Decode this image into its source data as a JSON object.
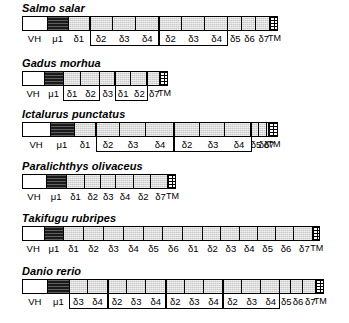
{
  "figure": {
    "type": "gene-segment-map",
    "fills": {
      "vh": "white",
      "mu1": "black",
      "delta": "light-gray-stipple",
      "tm": "cross-hatched-grid"
    },
    "colors": {
      "outline": "#000000",
      "delta_fill": "#c9c9c9",
      "mu_fill": "#1a1a1a",
      "vh_fill": "#ffffff",
      "page_bg": "#ffffff"
    }
  },
  "rows": [
    {
      "species": "Salmo salar",
      "bar_left": 22,
      "bar_width": 256,
      "segments": [
        {
          "label": "VH",
          "fill": "f-white",
          "w": 28
        },
        {
          "label": "μ1",
          "fill": "f-black",
          "w": 24
        },
        {
          "label": "δ1",
          "fill": "f-gray",
          "w": 24
        },
        {
          "label": "δ2",
          "fill": "f-gray",
          "w": 26
        },
        {
          "label": "δ3",
          "fill": "f-gray",
          "w": 26
        },
        {
          "label": "δ4",
          "fill": "f-gray",
          "w": 26
        },
        {
          "label": "δ2",
          "fill": "f-gray",
          "w": 26
        },
        {
          "label": "δ3",
          "fill": "f-gray",
          "w": 26
        },
        {
          "label": "δ4",
          "fill": "f-gray",
          "w": 26
        },
        {
          "label": "δ5",
          "fill": "f-gray",
          "w": 16
        },
        {
          "label": "δ6",
          "fill": "f-gray",
          "w": 16
        },
        {
          "label": "δ7",
          "fill": "f-gray",
          "w": 16
        },
        {
          "label": "TM",
          "fill": "f-grid",
          "w": 8
        }
      ],
      "brackets": [
        {
          "start_index": 3,
          "end_index": 5
        },
        {
          "start_index": 6,
          "end_index": 8
        }
      ]
    },
    {
      "species": "Gadus morhua",
      "bar_left": 22,
      "bar_width": 146,
      "segments": [
        {
          "label": "VH",
          "fill": "f-white",
          "w": 25
        },
        {
          "label": "μ1",
          "fill": "f-black",
          "w": 22
        },
        {
          "label": "δ1",
          "fill": "f-gray",
          "w": 20
        },
        {
          "label": "δ2",
          "fill": "f-gray",
          "w": 22
        },
        {
          "label": "δ3",
          "fill": "f-gray",
          "w": 17
        },
        {
          "label": "δ1",
          "fill": "f-gray",
          "w": 18
        },
        {
          "label": "δ2",
          "fill": "f-gray",
          "w": 19
        },
        {
          "label": "δ7",
          "fill": "f-gray",
          "w": 15
        },
        {
          "label": "TM",
          "fill": "f-grid",
          "w": 8
        }
      ],
      "brackets": [
        {
          "start_index": 2,
          "end_index": 3
        },
        {
          "start_index": 5,
          "end_index": 6
        }
      ]
    },
    {
      "species": "Ictalurus punctatus",
      "bar_left": 22,
      "bar_width": 256,
      "segments": [
        {
          "label": "VH",
          "fill": "f-white",
          "w": 28
        },
        {
          "label": "μ1",
          "fill": "f-black",
          "w": 24
        },
        {
          "label": "δ1",
          "fill": "f-gray",
          "w": 22
        },
        {
          "label": "δ2",
          "fill": "f-gray",
          "w": 24
        },
        {
          "label": "δ3",
          "fill": "f-gray",
          "w": 26
        },
        {
          "label": "δ4",
          "fill": "f-gray",
          "w": 28
        },
        {
          "label": "δ2",
          "fill": "f-gray",
          "w": 26
        },
        {
          "label": "δ3",
          "fill": "f-gray",
          "w": 26
        },
        {
          "label": "δ4",
          "fill": "f-gray",
          "w": 26
        },
        {
          "label": "δ5",
          "fill": "f-gray",
          "w": 8
        },
        {
          "label": "δ6",
          "fill": "f-gray",
          "w": 8
        },
        {
          "label": "δ7",
          "fill": "f-gray",
          "w": 2
        },
        {
          "label": "TM",
          "fill": "f-grid",
          "w": 8
        }
      ],
      "brackets": [
        {
          "start_index": 3,
          "end_index": 5
        },
        {
          "start_index": 6,
          "end_index": 8
        }
      ]
    },
    {
      "species": "Paralichthys olivaceus",
      "bar_left": 22,
      "bar_width": 154,
      "segments": [
        {
          "label": "VH",
          "fill": "f-white",
          "w": 27
        },
        {
          "label": "μ1",
          "fill": "f-black",
          "w": 23
        },
        {
          "label": "δ1",
          "fill": "f-gray",
          "w": 21
        },
        {
          "label": "δ2",
          "fill": "f-gray",
          "w": 18
        },
        {
          "label": "δ3",
          "fill": "f-gray",
          "w": 17
        },
        {
          "label": "δ4",
          "fill": "f-gray",
          "w": 21
        },
        {
          "label": "δ2",
          "fill": "f-gray",
          "w": 20
        },
        {
          "label": "δ7",
          "fill": "f-gray",
          "w": 19
        },
        {
          "label": "TM",
          "fill": "f-grid",
          "w": 8
        }
      ],
      "brackets": []
    },
    {
      "species": "Takifugu rubripes",
      "bar_left": 22,
      "bar_width": 298,
      "segments": [
        {
          "label": "VH",
          "fill": "f-white",
          "w": 28
        },
        {
          "label": "μ1",
          "fill": "f-black",
          "w": 24
        },
        {
          "label": "δ1",
          "fill": "f-gray",
          "w": 25
        },
        {
          "label": "δ2",
          "fill": "f-gray",
          "w": 25
        },
        {
          "label": "δ3",
          "fill": "f-gray",
          "w": 25
        },
        {
          "label": "δ4",
          "fill": "f-gray",
          "w": 25
        },
        {
          "label": "δ5",
          "fill": "f-gray",
          "w": 25
        },
        {
          "label": "δ6",
          "fill": "f-gray",
          "w": 25
        },
        {
          "label": "δ1",
          "fill": "f-gray",
          "w": 25
        },
        {
          "label": "δ2",
          "fill": "f-gray",
          "w": 23
        },
        {
          "label": "δ3",
          "fill": "f-gray",
          "w": 23
        },
        {
          "label": "δ4",
          "fill": "f-gray",
          "w": 23
        },
        {
          "label": "δ5",
          "fill": "f-gray",
          "w": 23
        },
        {
          "label": "δ6",
          "fill": "f-gray",
          "w": 23
        },
        {
          "label": "δ7",
          "fill": "f-gray",
          "w": 23
        },
        {
          "label": "TM",
          "fill": "f-grid",
          "w": 8
        }
      ],
      "brackets": []
    },
    {
      "species": "Danio rerio",
      "bar_left": 22,
      "bar_width": 302,
      "segments": [
        {
          "label": "VH",
          "fill": "f-white",
          "w": 28
        },
        {
          "label": "μ1",
          "fill": "f-black",
          "w": 24
        },
        {
          "label": "δ3",
          "fill": "f-gray",
          "w": 20
        },
        {
          "label": "δ4",
          "fill": "f-gray",
          "w": 22
        },
        {
          "label": "δ2",
          "fill": "f-gray",
          "w": 21
        },
        {
          "label": "δ3",
          "fill": "f-gray",
          "w": 21
        },
        {
          "label": "δ4",
          "fill": "f-gray",
          "w": 22
        },
        {
          "label": "δ2",
          "fill": "f-gray",
          "w": 21
        },
        {
          "label": "δ3",
          "fill": "f-gray",
          "w": 21
        },
        {
          "label": "δ4",
          "fill": "f-gray",
          "w": 21
        },
        {
          "label": "δ2",
          "fill": "f-gray",
          "w": 21
        },
        {
          "label": "δ3",
          "fill": "f-gray",
          "w": 21
        },
        {
          "label": "δ4",
          "fill": "f-gray",
          "w": 21
        },
        {
          "label": "δ5",
          "fill": "f-gray",
          "w": 13
        },
        {
          "label": "δ6",
          "fill": "f-gray",
          "w": 13
        },
        {
          "label": "δ7",
          "fill": "f-gray",
          "w": 14
        },
        {
          "label": "TM",
          "fill": "f-grid",
          "w": 8
        }
      ],
      "brackets": [
        {
          "start_index": 2,
          "end_index": 3
        },
        {
          "start_index": 4,
          "end_index": 6
        },
        {
          "start_index": 7,
          "end_index": 9
        },
        {
          "start_index": 10,
          "end_index": 12
        }
      ]
    }
  ],
  "layout": {
    "row_tops": [
      2,
      57,
      108,
      160,
      212,
      265
    ],
    "name_offset": 0,
    "bar_offset": 14,
    "label_offset": 30,
    "bar_height": 15
  }
}
